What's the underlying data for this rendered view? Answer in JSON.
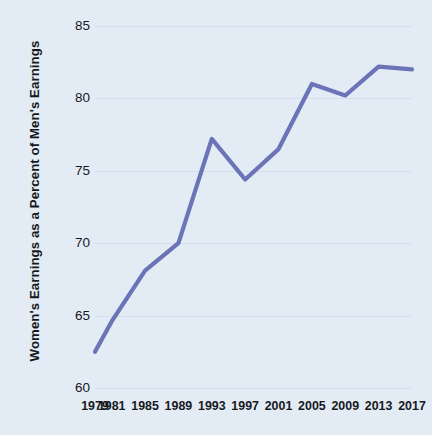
{
  "chart_data": {
    "type": "line",
    "title": "",
    "xlabel": "",
    "ylabel": "Women's Earnings as a Percent of Men's Earnings",
    "categories": [
      "1979",
      "1981",
      "1985",
      "1989",
      "1993",
      "1997",
      "2001",
      "2005",
      "2009",
      "2013",
      "2017"
    ],
    "x": [
      1979,
      1981,
      1985,
      1989,
      1993,
      1997,
      2001,
      2005,
      2009,
      2013,
      2017
    ],
    "values": [
      62.5,
      64.6,
      68.1,
      70.0,
      77.2,
      74.4,
      76.5,
      81.0,
      80.2,
      82.2,
      82.0
    ],
    "series": [
      {
        "name": "Women's earnings as a percent of men's earnings",
        "values": [
          62.5,
          64.6,
          68.1,
          70.0,
          77.2,
          74.4,
          76.5,
          81.0,
          80.2,
          82.2,
          82.0
        ]
      }
    ],
    "ylim": [
      60,
      85
    ],
    "xlim": [
      1979,
      2017
    ],
    "y_ticks": [
      60,
      65,
      70,
      75,
      80,
      85
    ],
    "y_tick_labels": [
      "60",
      "65",
      "70",
      "75",
      "80",
      "85"
    ],
    "x_tick_labels": [
      "1979",
      "1981",
      "1985",
      "1989",
      "1993",
      "1997",
      "2001",
      "2005",
      "2009",
      "2013",
      "2017"
    ],
    "grid": true,
    "legend": false,
    "legend_position": "none",
    "annotations": [],
    "colors": {
      "line": "#6b74b6",
      "background": "#e3ebf5",
      "gridline": "#d3dfee",
      "text": "#17191d"
    },
    "line_width": 4.2
  }
}
